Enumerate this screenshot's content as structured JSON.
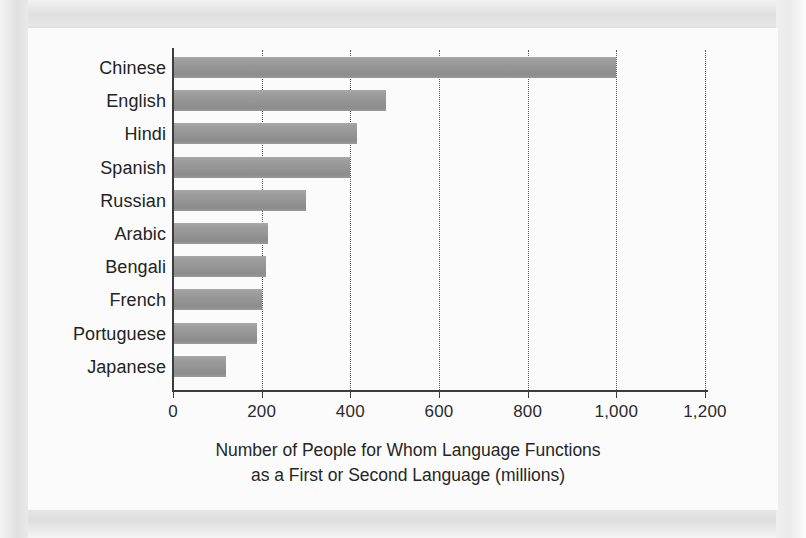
{
  "chart_data": {
    "type": "bar",
    "orientation": "horizontal",
    "title": "",
    "subtitle": "",
    "xlabel": "Number of People for Whom Language Functions as a First or Second Language (millions)",
    "xlabel_lines": [
      "Number of People for Whom Language Functions",
      "as a First or Second Language (millions)"
    ],
    "ylabel": "",
    "categories": [
      "Chinese",
      "English",
      "Hindi",
      "Spanish",
      "Russian",
      "Arabic",
      "Bengali",
      "French",
      "Portuguese",
      "Japanese"
    ],
    "values": [
      1000,
      480,
      415,
      400,
      300,
      215,
      210,
      200,
      190,
      120
    ],
    "xlim": [
      0,
      1200
    ],
    "xticks": [
      0,
      200,
      400,
      600,
      800,
      1000,
      1200
    ],
    "xtick_labels": [
      "0",
      "200",
      "400",
      "600",
      "800",
      "1,000",
      "1,200"
    ],
    "grid": "vertical-dotted",
    "legend": "none",
    "bar_color": "#9a9a9a",
    "axis_color": "#3c3c3c",
    "gridline_color": "#5a5a5a",
    "text_color": "#232323",
    "plot_background": "#fbfbfb",
    "page_background": "#e2e2e2"
  }
}
